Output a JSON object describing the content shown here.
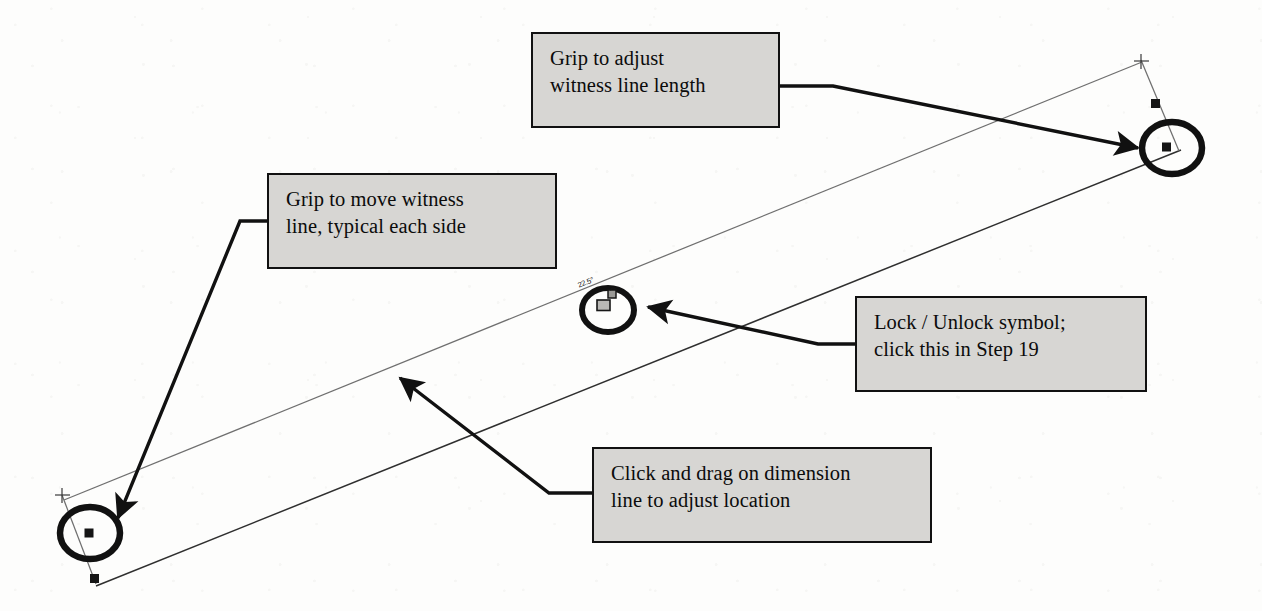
{
  "diagram": {
    "background_color": "#fdfdfc",
    "callout_fill": "#d7d6d3",
    "callout_border": "#111111",
    "dimension_line_color": "#6f6f6f",
    "geometry_line_color": "#2b2b2b",
    "grip_color": "#1a1a1a"
  },
  "dimension": {
    "value_label": "22.5°"
  },
  "callouts": [
    {
      "name": "grip-adjust-witness-length",
      "line1": "Grip to adjust",
      "line2": "witness line length"
    },
    {
      "name": "grip-move-witness-line",
      "line1": "Grip to move witness",
      "line2": "line, typical each side"
    },
    {
      "name": "lock-unlock-symbol",
      "line1": "Lock / Unlock symbol;",
      "line2": "click this in Step 19"
    },
    {
      "name": "click-drag-dimension-line",
      "line1": "Click and drag on dimension",
      "line2": "line to adjust location"
    }
  ],
  "markers": {
    "lock_icon": "open-padlock-icon",
    "extension_origin_left": "cross-mark",
    "extension_origin_right": "cross-mark",
    "grip_square": "square-grip",
    "grip_highlight": "ellipse-highlight"
  }
}
